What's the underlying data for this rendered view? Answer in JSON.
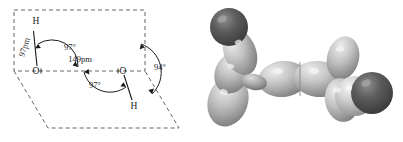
{
  "figure": {
    "background_color": "#ffffff",
    "width": 403,
    "height": 142
  },
  "diagram": {
    "caption": "",
    "line_color": "#1a1a1a",
    "dash_color": "#55555a",
    "atoms": [
      {
        "id": "h-top",
        "label": "H",
        "x": 36,
        "y": 24
      },
      {
        "id": "o-left",
        "label": "O",
        "x": 36,
        "y": 71
      },
      {
        "id": "o-right",
        "label": "O",
        "x": 123,
        "y": 71
      },
      {
        "id": "h-bottom",
        "label": "H",
        "x": 134,
        "y": 106
      }
    ],
    "measurements": [
      {
        "id": "bond-oh-left",
        "label": "97pm",
        "x": 27,
        "y": 48,
        "rotation": -72
      },
      {
        "id": "bond-oo",
        "label": "149pm",
        "x": 80,
        "y": 62
      },
      {
        "id": "angle-left",
        "label": "97°",
        "x": 70,
        "y": 50
      },
      {
        "id": "angle-right",
        "label": "97°",
        "x": 95,
        "y": 88
      },
      {
        "id": "angle-dihedral",
        "label": "94°",
        "x": 160,
        "y": 70
      }
    ]
  },
  "render": {
    "alt": "grayscale three-dimensional space-filling model of hydrogen peroxide",
    "atom_dark_color": "#4a4a4a",
    "atom_light_color": "#c9c9c9",
    "highlight_color": "#f2f2f2",
    "shadow_color": "#6e6e6e"
  }
}
